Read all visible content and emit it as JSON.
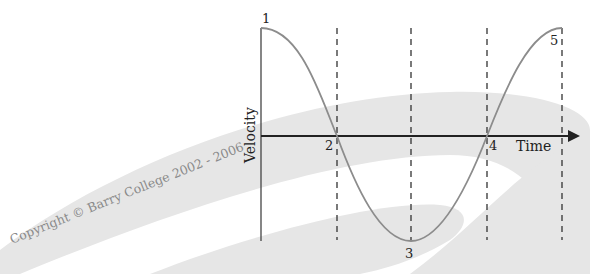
{
  "diagram": {
    "axes": {
      "x_label": "Time",
      "y_label": "Velocity"
    },
    "points": [
      {
        "label": "1",
        "description": "maximum positive velocity"
      },
      {
        "label": "2",
        "description": "zero velocity crossing"
      },
      {
        "label": "3",
        "description": "maximum negative velocity"
      },
      {
        "label": "4",
        "description": "zero velocity crossing"
      },
      {
        "label": "5",
        "description": "maximum positive velocity"
      }
    ],
    "watermark": "Copyright © Barry College 2002 - 2006"
  },
  "colors": {
    "background": "#ffffff",
    "swoosh": "#e4e4e4",
    "axis": "#222222",
    "curve": "#8c8c8c",
    "dashed": "#333333",
    "watermark_text": "#8a8a8a"
  }
}
